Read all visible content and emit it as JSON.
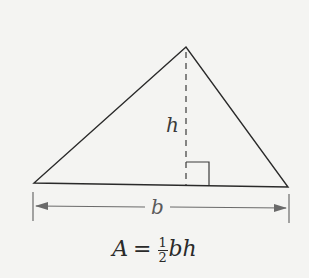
{
  "diagram": {
    "labels": {
      "height": "h",
      "base": "b"
    },
    "formula": {
      "lhs": "A",
      "equals": "=",
      "numerator": "1",
      "denominator": "2",
      "rhs_vars": "bh"
    },
    "colors": {
      "line": "#2a2a2a",
      "dimension": "#6a6a6a",
      "background": "#f4f4f2"
    }
  }
}
